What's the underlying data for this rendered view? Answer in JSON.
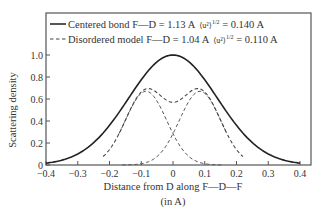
{
  "chart_data": {
    "type": "line",
    "title": "",
    "xlabel": "Distance from D along F—D—F",
    "xlabel_unit": "(in A)",
    "ylabel": "Scattering density",
    "xlim": [
      -0.4,
      0.4
    ],
    "ylim": [
      0,
      1.0
    ],
    "xticks": [
      -0.4,
      -0.3,
      -0.2,
      -0.1,
      0,
      0.1,
      0.2,
      0.3,
      0.4
    ],
    "xtick_labels": [
      "−0.4",
      "−0.3",
      "−0.2",
      "−0.1",
      "0",
      "0.1",
      "0.2",
      "0.3",
      "0.4"
    ],
    "yticks": [
      0,
      0.2,
      0.4,
      0.6,
      0.8,
      1.0
    ],
    "ytick_labels": [
      "0",
      "0.2",
      "0.4",
      "0.6",
      "0.8",
      "1.0"
    ],
    "grid": false,
    "legend_position": "top, inside frame",
    "legend": [
      {
        "style": "solid",
        "label": "Centered bond F—D = 1.13 A ⟨u²⟩¹ᐟ² = 0.140 A"
      },
      {
        "style": "dashed",
        "label": "Disordered model F—D = 1.04 A ⟨u²⟩¹ᐟ² = 0.110 A"
      }
    ],
    "series": [
      {
        "name": "Centered bond",
        "style": "solid",
        "model": "gaussian",
        "center": 0.0,
        "sigma": 0.14,
        "amplitude": 1.0,
        "x": [
          -0.4,
          -0.35,
          -0.3,
          -0.25,
          -0.2,
          -0.15,
          -0.1,
          -0.05,
          0,
          0.05,
          0.1,
          0.15,
          0.2,
          0.25,
          0.3,
          0.35,
          0.4
        ],
        "y": [
          0.02,
          0.04,
          0.1,
          0.2,
          0.36,
          0.56,
          0.77,
          0.94,
          1.0,
          0.94,
          0.77,
          0.56,
          0.36,
          0.2,
          0.1,
          0.04,
          0.02
        ]
      },
      {
        "name": "Disordered model (sum)",
        "style": "dashed",
        "model": "sum of two gaussians",
        "x": [
          -0.2,
          -0.15,
          -0.1,
          -0.05,
          0,
          0.05,
          0.1,
          0.15,
          0.2
        ],
        "y": [
          0.37,
          0.58,
          0.79,
          0.95,
          1.02,
          0.95,
          0.79,
          0.58,
          0.37
        ]
      },
      {
        "name": "Disordered component (left)",
        "style": "dashed",
        "model": "gaussian",
        "center": -0.085,
        "sigma": 0.065,
        "amplitude": 0.67,
        "x": [
          -0.17,
          -0.15,
          -0.1,
          -0.085,
          -0.05,
          0,
          0.05,
          0.1,
          0.16
        ],
        "y": [
          0.05,
          0.2,
          0.65,
          0.67,
          0.58,
          0.47,
          0.18,
          0.05,
          0.01
        ]
      },
      {
        "name": "Disordered component (right)",
        "style": "dashed",
        "model": "gaussian",
        "center": 0.085,
        "sigma": 0.065,
        "amplitude": 0.67,
        "x": [
          -0.16,
          -0.1,
          -0.05,
          0,
          0.05,
          0.085,
          0.1,
          0.15,
          0.17
        ],
        "y": [
          0.01,
          0.05,
          0.18,
          0.47,
          0.58,
          0.67,
          0.65,
          0.2,
          0.05
        ]
      }
    ]
  },
  "legend": {
    "solid_label": "Centered bond F—D = 1.13 A",
    "solid_stat": "⟨u²⟩",
    "solid_exp": "1/2",
    "solid_value": " = 0.140 A",
    "dashed_label": "Disordered model F—D = 1.04 A",
    "dashed_stat": "⟨u²⟩",
    "dashed_exp": "1/2",
    "dashed_value": " = 0.110 A"
  },
  "axes": {
    "ylabel": "Scattering density",
    "xlabel": "Distance from D along F—D—F",
    "xlabel_unit": "(in A)",
    "xtick_labels": [
      "−0.4",
      "−0.3",
      "−0.2",
      "−0.1",
      "0",
      "0.1",
      "0.2",
      "0.3",
      "0.4"
    ],
    "ytick_labels": [
      "0",
      "0.2",
      "0.4",
      "0.6",
      "0.8",
      "1.0"
    ]
  },
  "colors": {
    "line": "#2a2a2a",
    "dashed": "#555555",
    "frame": "#555555",
    "background": "#ffffff"
  }
}
